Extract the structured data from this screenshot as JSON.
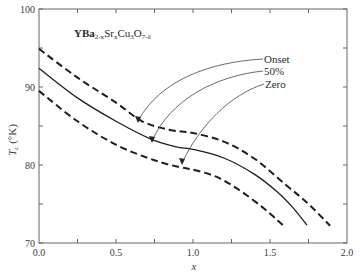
{
  "chart_data": {
    "type": "line",
    "title": "YBa2-xSrxCu3O7-δ",
    "title_parts": {
      "main1": "YBa",
      "sub1": "2-x",
      "main2": "Sr",
      "sub2": "x",
      "main3": "Cu",
      "sub3": "3",
      "main4": "O",
      "sub4": "7-δ"
    },
    "xlabel": "x",
    "ylabel": "Tc (°K)",
    "ylabel_parts": {
      "main": "T",
      "sub": "c",
      "rest": " (°K)"
    },
    "xlim": [
      0.0,
      2.0
    ],
    "ylim": [
      70,
      100
    ],
    "x_ticks": [
      "0.0",
      "0.5",
      "1.0",
      "1.5",
      "2.0"
    ],
    "x_tick_values": [
      0.0,
      0.5,
      1.0,
      1.5,
      2.0
    ],
    "x_minor_ticks": [
      0.25,
      0.75,
      1.25,
      1.75
    ],
    "y_ticks": [
      "70",
      "80",
      "90",
      "100"
    ],
    "y_tick_values": [
      70,
      80,
      90,
      100
    ],
    "y_minor_ticks": [
      75,
      85,
      95
    ],
    "grid": false,
    "legend_position": "annotated arrows, upper right",
    "series": [
      {
        "name": "Onset",
        "style": "dashed",
        "x": [
          0.0,
          0.25,
          0.5,
          0.67,
          0.85,
          1.0,
          1.2,
          1.4,
          1.6,
          1.75,
          1.89
        ],
        "values": [
          94.9,
          91.2,
          88.0,
          85.6,
          84.5,
          84.1,
          83.0,
          80.8,
          77.5,
          75.0,
          72.2
        ]
      },
      {
        "name": "50%",
        "style": "solid",
        "x": [
          0.0,
          0.25,
          0.5,
          0.73,
          0.9,
          1.0,
          1.2,
          1.4,
          1.55,
          1.65,
          1.74
        ],
        "values": [
          92.4,
          88.6,
          85.6,
          83.3,
          82.3,
          82.0,
          80.9,
          78.8,
          76.5,
          74.5,
          72.3
        ]
      },
      {
        "name": "Zero",
        "style": "dashed",
        "x": [
          0.0,
          0.25,
          0.5,
          0.75,
          0.92,
          1.0,
          1.15,
          1.3,
          1.45,
          1.55,
          1.6
        ],
        "values": [
          89.5,
          85.6,
          82.6,
          80.6,
          79.7,
          79.4,
          78.5,
          76.8,
          74.6,
          72.9,
          72.0
        ]
      }
    ],
    "annotations": [
      {
        "label": "Onset",
        "arrow_to": {
          "x": 0.64,
          "y": 85.8
        }
      },
      {
        "label": "50%",
        "arrow_to": {
          "x": 0.73,
          "y": 83.3
        }
      },
      {
        "label": "Zero",
        "arrow_to": {
          "x": 0.93,
          "y": 80.0
        }
      }
    ]
  },
  "colors": {
    "line": "#1e1e1e",
    "axis": "#555555",
    "arrow": "#444444"
  }
}
